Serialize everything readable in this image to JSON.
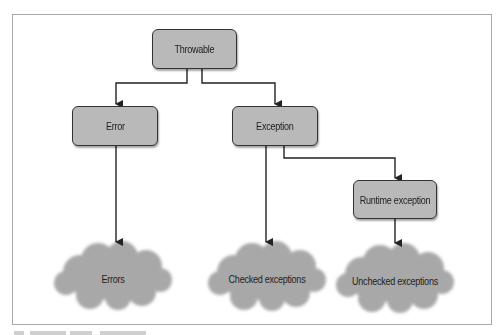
{
  "diagram": {
    "type": "hierarchy",
    "colors": {
      "box_fill": "#b9b9b9",
      "box_border": "#333333",
      "cloud_fill": "#a8a8a8",
      "line": "#222222",
      "frame": "#a9a9a9"
    },
    "nodes": {
      "throwable": {
        "label": "Throwable"
      },
      "error": {
        "label": "Error"
      },
      "exception": {
        "label": "Exception"
      },
      "runtime_exception": {
        "label": "Runtime exception"
      }
    },
    "clouds": {
      "errors": {
        "label": "Errors"
      },
      "checked": {
        "label": "Checked exceptions"
      },
      "unchecked": {
        "label": "Unchecked exceptions"
      }
    },
    "edges": [
      {
        "from": "Throwable",
        "to": "Error"
      },
      {
        "from": "Throwable",
        "to": "Exception"
      },
      {
        "from": "Error",
        "to": "Errors"
      },
      {
        "from": "Exception",
        "to": "Checked exceptions"
      },
      {
        "from": "Exception",
        "to": "Runtime exception"
      },
      {
        "from": "Runtime exception",
        "to": "Unchecked exceptions"
      }
    ]
  }
}
